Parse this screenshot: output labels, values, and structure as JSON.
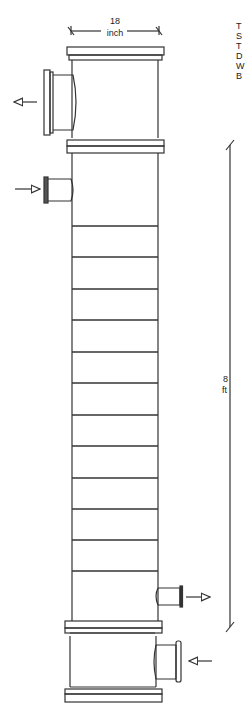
{
  "diagram": {
    "width_dimension": {
      "value": "18",
      "unit": "inch"
    },
    "height_dimension": {
      "value": "8",
      "unit": "ft"
    },
    "tray_count": 12,
    "trays_y": [
      226,
      257,
      289,
      320,
      352,
      383,
      415,
      446,
      478,
      509,
      540,
      571
    ],
    "side_labels": [
      "T",
      "S",
      "T",
      "D",
      "W",
      "B"
    ],
    "nozzles": [
      {
        "name": "top-vapor-outlet",
        "direction": "out",
        "side": "left"
      },
      {
        "name": "feed-inlet",
        "direction": "in",
        "side": "left"
      },
      {
        "name": "bottom-liquid-outlet",
        "direction": "out",
        "side": "right"
      },
      {
        "name": "reboiler-vapor-inlet",
        "direction": "in",
        "side": "right"
      }
    ],
    "colors": {
      "line": "#333333",
      "background": "#ffffff"
    }
  }
}
